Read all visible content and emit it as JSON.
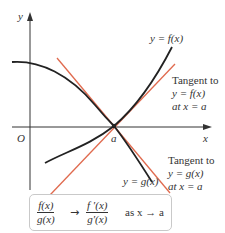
{
  "axes": {
    "x_label": "x",
    "y_label": "y",
    "origin_label": "O",
    "point_label": "a"
  },
  "curves": {
    "f_label": "y = f(x)",
    "g_label": "y = g(x)"
  },
  "tangents": {
    "f": {
      "line1": "Tangent to",
      "line2": "y = f(x)",
      "line3": "at x = a"
    },
    "g": {
      "line1": "Tangent to",
      "line2": "y = g(x)",
      "line3": "at x = a"
    }
  },
  "formula": {
    "lhs_num": "f(x)",
    "lhs_den": "g(x)",
    "arrow": "→",
    "rhs_num": "f ′(x)",
    "rhs_den": "g′(x)",
    "condition": "as x → a"
  },
  "colors": {
    "curve": "#222222",
    "tangent": "#e06a4e",
    "axis": "#333333",
    "box_border": "#c9c9c9"
  }
}
